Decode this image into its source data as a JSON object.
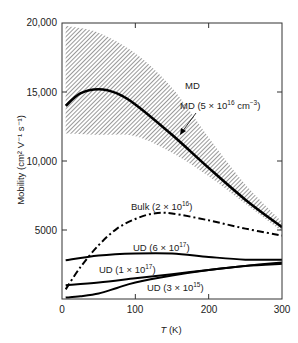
{
  "chart_data": {
    "type": "line",
    "title": "",
    "xlabel": "T (K)",
    "ylabel": "Mobility (cm² V⁻¹ s⁻¹)",
    "xlim": [
      0,
      300
    ],
    "ylim": [
      0,
      20000
    ],
    "x_ticks": [
      "0",
      "100",
      "200",
      "300"
    ],
    "y_ticks": [
      "5000",
      "10,000",
      "15,000",
      "20,000"
    ],
    "grid": false,
    "series": [
      {
        "name": "MD band (upper)",
        "style": "hatched-band",
        "x": [
          5,
          50,
          100,
          150,
          200,
          250,
          300
        ],
        "values": [
          19800,
          19300,
          17800,
          15300,
          11700,
          8300,
          5600
        ]
      },
      {
        "name": "MD band (lower)",
        "style": "hatched-band",
        "x": [
          5,
          50,
          100,
          150,
          200,
          250,
          300
        ],
        "values": [
          12000,
          11900,
          11800,
          10600,
          8900,
          6900,
          4900
        ]
      },
      {
        "name": "MD (5 × 10¹⁶ cm⁻³)",
        "style": "solid-bold",
        "x": [
          5,
          25,
          50,
          75,
          100,
          150,
          200,
          250,
          300
        ],
        "values": [
          14000,
          14900,
          15200,
          14900,
          14100,
          11900,
          9500,
          7200,
          5200
        ]
      },
      {
        "name": "Bulk (2 × 10¹⁶)",
        "style": "dash-dot",
        "x": [
          5,
          25,
          50,
          75,
          100,
          125,
          150,
          200,
          250,
          300
        ],
        "values": [
          700,
          2300,
          3900,
          5100,
          5800,
          6200,
          6200,
          5700,
          5100,
          4600
        ]
      },
      {
        "name": "UD (6 × 10¹⁷)",
        "style": "solid",
        "x": [
          5,
          50,
          100,
          150,
          200,
          250,
          300
        ],
        "values": [
          2800,
          3150,
          3300,
          3300,
          3050,
          2850,
          2850
        ]
      },
      {
        "name": "UD (1 × 10¹⁷)",
        "style": "solid",
        "x": [
          5,
          50,
          100,
          150,
          200,
          250,
          300
        ],
        "values": [
          1000,
          1200,
          1500,
          1800,
          2100,
          2400,
          2650
        ]
      },
      {
        "name": "UD (3 × 10¹⁵)",
        "style": "solid",
        "x": [
          5,
          25,
          50,
          75,
          100,
          150,
          200,
          250,
          300
        ],
        "values": [
          100,
          200,
          400,
          800,
          1200,
          1700,
          2100,
          2400,
          2550
        ]
      }
    ],
    "annotations": [
      "MD",
      "MD (5 × 10¹⁶ cm⁻³)",
      "Bulk (2 × 10¹⁶)",
      "UD (6 × 10¹⁷)",
      "UD (1 × 10¹⁷)",
      "UD (3 × 10¹⁵)"
    ]
  },
  "labels": {
    "md": "MD",
    "md_line": "MD (5 × 10",
    "md_line_exp": "16",
    "md_line_unit": " cm",
    "md_line_unit_exp": "−3",
    "bulk": "Bulk (2 × 10",
    "bulk_exp": "16",
    "ud6": "UD (6 × 10",
    "ud6_exp": "17",
    "ud1": "UD (1 × 10",
    "ud1_exp": "17",
    "ud3": "UD (3 × 10",
    "ud3_exp": "15",
    "close": ")",
    "xlabel_t": "T",
    "xlabel_k": " (K)",
    "ylabel": "Mobility (cm² V⁻¹ s⁻¹)"
  }
}
